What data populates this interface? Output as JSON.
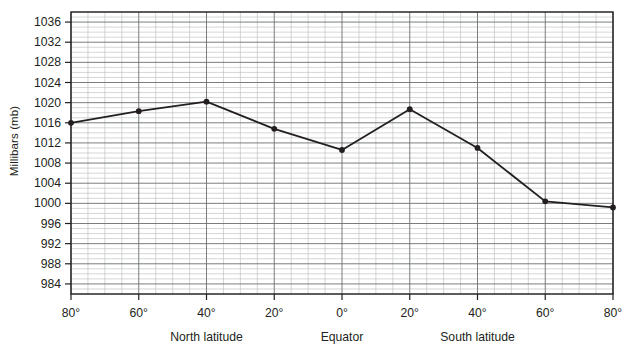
{
  "chart_data": {
    "type": "line",
    "title": "",
    "subtitle": "",
    "xlabel": "",
    "ylabel": "Millibars (mb)",
    "x_group_labels": [
      "North latitude",
      "Equator",
      "South latitude"
    ],
    "categories": [
      "80°",
      "60°",
      "40°",
      "20°",
      "0°",
      "20°",
      "40°",
      "60°",
      "80°"
    ],
    "x_tick_labels": [
      "80°",
      "60°",
      "40°",
      "20°",
      "0°",
      "20°",
      "40°",
      "60°",
      "80°"
    ],
    "x_values": [
      80,
      60,
      40,
      20,
      0,
      -20,
      -40,
      -60,
      -80
    ],
    "values": [
      1016.0,
      1018.3,
      1020.2,
      1014.8,
      1010.6,
      1018.7,
      1011.0,
      1000.4,
      999.2
    ],
    "series": [
      {
        "name": "Mean sea-level pressure",
        "values": [
          1016.0,
          1018.3,
          1020.2,
          1014.8,
          1010.6,
          1018.7,
          1011.0,
          1000.4,
          999.2
        ]
      }
    ],
    "y_tick_labels": [
      "1036",
      "1032",
      "1028",
      "1024",
      "1020",
      "1016",
      "1012",
      "1008",
      "1004",
      "1000",
      "996",
      "992",
      "988",
      "984"
    ],
    "y_ticks": [
      1036,
      1032,
      1028,
      1024,
      1020,
      1016,
      1012,
      1008,
      1004,
      1000,
      996,
      992,
      988,
      984
    ],
    "ylim": [
      982,
      1038
    ],
    "xlim": [
      80,
      -80
    ],
    "y_major_step": 4,
    "y_minor_step": 1,
    "x_major_step": 20,
    "x_minor_step": 5,
    "grid": true,
    "legend": false,
    "legend_position": "none",
    "marker": "filled-circle",
    "line_color": "#231f20",
    "marker_color": "#231f20",
    "grid_major_color": "#6d6e71",
    "grid_minor_color": "#b9babc",
    "axis_color": "#231f20",
    "background": "#ffffff"
  }
}
